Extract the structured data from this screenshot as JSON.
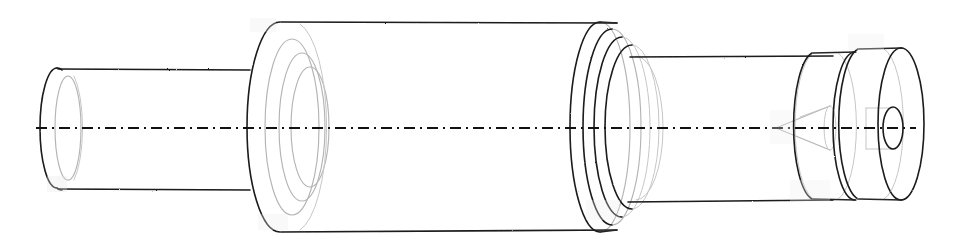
{
  "document": {
    "title": "Stepped Shaft Assembly - Pictorial Wireframe View",
    "drawing_type": "engineering-line-drawing",
    "projection": "isometric-pictorial",
    "background_color": "#ffffff",
    "visible_edge_color": "#1a1a1a",
    "hidden_edge_color": "#b4b4b4",
    "axis_color": "#111111",
    "scanned": true
  },
  "canvas": {
    "width": 958,
    "height": 246
  },
  "geometry": {
    "axis": {
      "name": "centerline",
      "style": "dash-dot",
      "y": 128,
      "x_start": 36,
      "x_end": 916,
      "dash_pattern": "11 5 2 5"
    },
    "features": [
      {
        "id": "small-tube",
        "label": "Small hollow tube (left end)",
        "type": "cylinder",
        "face_center_x": 57,
        "face_center_y": 128,
        "rx": 17,
        "ry": 60,
        "x_left": 40,
        "x_right": 250,
        "top_y_left": 69,
        "top_y_right": 70,
        "bot_y_left": 188,
        "bot_y_right": 190,
        "bore_rx": 13,
        "bore_ry": 52,
        "bore_offset_x": 11
      },
      {
        "id": "large-cylinder",
        "label": "Large diameter cylinder (body)",
        "type": "cylinder",
        "face_center_x": 280,
        "face_center_y": 127,
        "rx": 33,
        "ry": 105,
        "x_left": 247,
        "x_right": 617,
        "top_y_left": 22,
        "top_y_right": 23,
        "bot_y_left": 231,
        "bot_y_right": 230,
        "counterbore_rings": [
          {
            "rx": 27,
            "ry": 88,
            "offset_x": 12
          },
          {
            "rx": 23,
            "ry": 74,
            "offset_x": 22
          },
          {
            "rx": 19,
            "ry": 60,
            "offset_x": 30
          }
        ]
      },
      {
        "id": "flange-ring-stack",
        "label": "Stacked flange rings (right shoulder of large cylinder)",
        "type": "ring-stack",
        "center_y": 127,
        "rings": [
          {
            "cx": 600,
            "rx": 30,
            "ry": 105
          },
          {
            "cx": 612,
            "rx": 29,
            "ry": 98
          },
          {
            "cx": 622,
            "rx": 28,
            "ry": 90
          },
          {
            "cx": 632,
            "rx": 27,
            "ry": 82
          }
        ]
      },
      {
        "id": "medium-cylinder",
        "label": "Medium diameter cylinder (right body)",
        "type": "cylinder",
        "face_center_x": 632,
        "face_center_y": 128,
        "rx": 27,
        "ry": 72,
        "x_left": 630,
        "x_right": 830,
        "top_y_left": 57,
        "top_y_right": 56,
        "bot_y_left": 202,
        "bot_y_right": 200
      },
      {
        "id": "internal-cone",
        "label": "Internal tapered cone (hidden)",
        "type": "cone",
        "apex_x": 776,
        "apex_y": 128,
        "base_x": 830,
        "base_ry": 22
      },
      {
        "id": "disc-front",
        "label": "End disc 1",
        "type": "disc",
        "cx": 833,
        "cy": 126,
        "rx": 22,
        "ry": 74
      },
      {
        "id": "disc-rear",
        "label": "End disc 2 (rightmost)",
        "type": "disc",
        "cx": 878,
        "cy": 124,
        "rx": 23,
        "ry": 76
      },
      {
        "id": "center-bore",
        "label": "Central through bore (right face)",
        "type": "bore",
        "cx": 893,
        "cy": 128,
        "rx": 10,
        "ry": 21
      }
    ]
  }
}
